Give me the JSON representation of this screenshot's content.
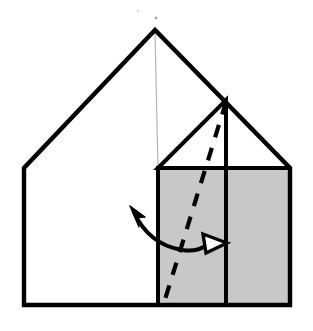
{
  "figure": {
    "title": "Origami fold step diagram",
    "background_color": "#ffffff",
    "ink_color": "#000000",
    "shade_color": "#c8c8c8",
    "guide_color": "#b4b4b4",
    "canvas": {
      "width": 313,
      "height": 331
    }
  },
  "geometry": {
    "house_outline": {
      "name": "house-outline",
      "points": "155,30 24,168 24,305 290,305 290,168",
      "stroke_width": 4.4,
      "fill": "#ffffff"
    },
    "center_guide_line": {
      "name": "center-guide-line",
      "x1": 155,
      "y1": 32,
      "x2": 158,
      "y2": 168,
      "stroke_width": 1.2,
      "color": "#b4b4b4"
    },
    "shaded_panel_left": {
      "name": "shaded-panel-left",
      "points": "158,168 226,168 226,305 158,305",
      "fill": "#c8c8c8"
    },
    "shaded_panel_right": {
      "name": "shaded-panel-right",
      "points": "226,168 290,168 290,305 226,305",
      "fill": "#c8c8c8"
    },
    "inner_triangle": {
      "name": "inner-triangle-flap",
      "points": "158,168 226,100 226,168",
      "fill": "#ffffff",
      "stroke_width": 4.0
    },
    "wall_left_vertical": {
      "name": "panel-left-edge",
      "x1": 158,
      "y1": 168,
      "x2": 158,
      "y2": 305,
      "stroke_width": 4.0
    },
    "panel_divider_vertical": {
      "name": "panel-divider-line",
      "x1": 226,
      "y1": 100,
      "x2": 226,
      "y2": 305,
      "stroke_width": 4.0
    },
    "panel_top_edge": {
      "name": "panel-top-edge",
      "x1": 158,
      "y1": 168,
      "x2": 290,
      "y2": 168,
      "stroke_width": 4.0
    },
    "dashed_fold_line": {
      "name": "dashed-fold-line",
      "x1": 226,
      "y1": 102,
      "x2": 163,
      "y2": 306,
      "stroke_width": 4.2,
      "dash_pattern": "13 11"
    },
    "curved_arrow": {
      "name": "fold-motion-arrow",
      "path": "M 134,212 C 143,232 158,246 182,250 C 196,252 203,248 209,244",
      "stroke_width": 4.0,
      "left_head": {
        "name": "arrowhead-left-filled",
        "points": "131,207 144,216 136,217 138,226",
        "style": "filled"
      },
      "right_head": {
        "name": "arrowhead-right-hollow",
        "points": "226,243 204,235 207,252",
        "style": "hollow",
        "stroke_width": 3.4
      }
    },
    "speck_marks": [
      {
        "name": "scan-speck-1",
        "cx": 138,
        "cy": 11,
        "r": 1.1,
        "opacity": 0.18
      },
      {
        "name": "scan-speck-2",
        "cx": 156,
        "cy": 18,
        "r": 1.4,
        "opacity": 0.35
      }
    ]
  }
}
